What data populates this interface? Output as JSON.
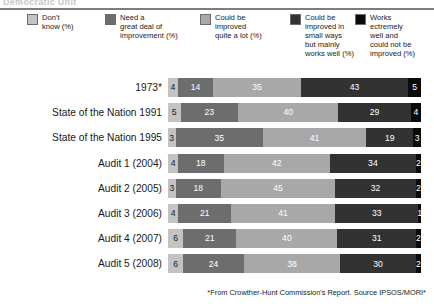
{
  "heading": "Democratic Unit",
  "legend": {
    "items": [
      {
        "label": "Don't\nknow (%)",
        "color": "#c3c3c3",
        "text_color": "#1a1a1a",
        "swatch_name": "legend-swatch-dont-know"
      },
      {
        "label": "Need a\ngreat deal of\nimprovement (%)",
        "color": "#6d6d6d",
        "text_color": "#ffffff",
        "swatch_name": "legend-swatch-need-great-deal"
      },
      {
        "label": "Could be\nimproved\nquite a lot (%)",
        "color": "#a8a8a8",
        "text_color": "#ffffff",
        "swatch_name": "legend-swatch-improved-quite-a-lot"
      },
      {
        "label": "Could be\nimproved in\nsmall ways\nbut mainly\nworks well (%)",
        "color": "#323232",
        "text_color": "#ffffff",
        "swatch_name": "legend-swatch-improved-small-ways"
      },
      {
        "label": "Works\nectremely\nwell and\ncould not be\nimproved (%)",
        "color": "#0a0a0a",
        "text_color": "#ffffff",
        "swatch_name": "legend-swatch-works-extremely-well"
      }
    ]
  },
  "footnote": "*From Crowther-Hunt Commission's Report. Source IPSOS/MORI*",
  "chart_data": {
    "type": "bar",
    "orientation": "horizontal",
    "stacked": true,
    "stack_total": 100,
    "title": "Democratic Unit",
    "xlabel": "",
    "ylabel": "",
    "xlim": [
      0,
      101
    ],
    "grid": false,
    "legend_position": "top",
    "categories": [
      "1973*",
      "State of the Nation 1991",
      "State of the Nation 1995",
      "Audit 1 (2004)",
      "Audit 2 (2005)",
      "Audit 3 (2006)",
      "Audit 4 (2007)",
      "Audit 5 (2008)"
    ],
    "series": [
      {
        "name": "Don't know (%)",
        "color": "#c3c3c3",
        "text_color": "#1a1a1a",
        "values": [
          4,
          5,
          3,
          4,
          3,
          4,
          6,
          6
        ]
      },
      {
        "name": "Need a great deal of improvement (%)",
        "color": "#6d6d6d",
        "text_color": "#ffffff",
        "values": [
          14,
          23,
          35,
          18,
          18,
          21,
          21,
          24
        ]
      },
      {
        "name": "Could be improved quite a lot (%)",
        "color": "#a8a8a8",
        "text_color": "#ffffff",
        "values": [
          35,
          40,
          41,
          42,
          45,
          41,
          40,
          38
        ]
      },
      {
        "name": "Could be improved in small ways but mainly works well (%)",
        "color": "#323232",
        "text_color": "#ffffff",
        "values": [
          43,
          29,
          19,
          34,
          32,
          33,
          31,
          30
        ]
      },
      {
        "name": "Works ectremely well and could not be improved (%)",
        "color": "#0a0a0a",
        "text_color": "#ffffff",
        "values": [
          5,
          4,
          3,
          2,
          2,
          1,
          2,
          2
        ]
      }
    ]
  }
}
